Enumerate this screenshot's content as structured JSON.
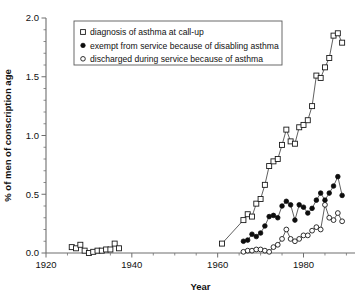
{
  "chart_data": {
    "type": "line",
    "title": "",
    "xlabel": "Year",
    "ylabel": "% of men of conscription age",
    "xlim": [
      1920,
      1992
    ],
    "ylim": [
      0.0,
      2.0
    ],
    "grid": false,
    "legend_position": "top-left",
    "x_ticks_major": [
      1920,
      1940,
      1960,
      1980
    ],
    "x_ticks_major_labels": [
      "1920",
      "1940",
      "1960",
      "1980"
    ],
    "x_tick_minor_step": 5,
    "y_ticks_major": [
      0.0,
      0.5,
      1.0,
      1.5,
      2.0
    ],
    "y_ticks_major_labels": [
      "0.0",
      "0.5",
      "1.0",
      "1.5",
      "2.0"
    ],
    "y_tick_minor_step": 0.1,
    "series": [
      {
        "name": "diagnosis of asthma at call-up",
        "marker": "open-square",
        "legend_marker": "open-square-icon",
        "segments": [
          {
            "x": [
              1926,
              1927,
              1928,
              1929,
              1930,
              1931,
              1932,
              1933,
              1934,
              1935,
              1936,
              1937
            ],
            "values": [
              0.05,
              0.04,
              0.07,
              0.02,
              0.0,
              0.01,
              0.02,
              0.02,
              0.03,
              0.03,
              0.08,
              0.04
            ]
          },
          {
            "x": [
              1961
            ],
            "values": [
              0.08
            ]
          },
          {
            "x": [
              1966,
              1967,
              1968,
              1969,
              1970,
              1971,
              1972,
              1973,
              1974,
              1975,
              1976,
              1977,
              1978,
              1979,
              1980,
              1981,
              1982,
              1983,
              1984,
              1985,
              1986,
              1987,
              1988,
              1989
            ],
            "values": [
              0.28,
              0.33,
              0.31,
              0.42,
              0.46,
              0.58,
              0.74,
              0.78,
              0.8,
              0.92,
              1.05,
              0.95,
              0.93,
              1.07,
              1.09,
              1.13,
              1.25,
              1.51,
              1.49,
              1.58,
              1.66,
              1.85,
              1.87,
              1.79
            ]
          }
        ]
      },
      {
        "name": "exempt from service because of disabling asthma",
        "marker": "filled-circle",
        "legend_marker": "filled-circle-icon",
        "segments": [
          {
            "x": [
              1966,
              1967,
              1968,
              1969,
              1970,
              1971,
              1972,
              1973,
              1974,
              1975,
              1976,
              1977,
              1978,
              1979,
              1980,
              1981,
              1982,
              1983,
              1984,
              1985,
              1986,
              1987,
              1988,
              1989
            ],
            "values": [
              0.1,
              0.11,
              0.16,
              0.14,
              0.17,
              0.23,
              0.31,
              0.32,
              0.3,
              0.4,
              0.44,
              0.41,
              0.28,
              0.41,
              0.39,
              0.34,
              0.38,
              0.45,
              0.51,
              0.45,
              0.51,
              0.57,
              0.65,
              0.49
            ]
          }
        ]
      },
      {
        "name": "discharged during service because of asthma",
        "marker": "open-circle",
        "legend_marker": "open-circle-icon",
        "segments": [
          {
            "x": [
              1966,
              1967,
              1968,
              1969,
              1970,
              1971,
              1972,
              1973,
              1974,
              1975,
              1976,
              1977,
              1978,
              1979,
              1980,
              1981,
              1982,
              1983,
              1984,
              1985,
              1986,
              1987,
              1988,
              1989
            ],
            "values": [
              0.01,
              0.02,
              0.02,
              0.03,
              0.03,
              0.02,
              0.01,
              0.05,
              0.07,
              0.12,
              0.2,
              0.12,
              0.1,
              0.12,
              0.15,
              0.15,
              0.19,
              0.22,
              0.2,
              0.41,
              0.3,
              0.28,
              0.34,
              0.27
            ]
          }
        ]
      }
    ]
  },
  "legend": {
    "entries": [
      {
        "label": "diagnosis of asthma at call-up",
        "marker": "open-square-icon"
      },
      {
        "label": "exempt from service because of disabling asthma",
        "marker": "filled-circle-icon"
      },
      {
        "label": "discharged during service because of asthma",
        "marker": "open-circle-icon"
      }
    ]
  }
}
